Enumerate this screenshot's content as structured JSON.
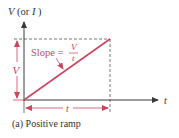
{
  "diagram": {
    "y_axis_label": {
      "main": "V",
      "paren_open": " (or ",
      "alt": "I",
      "paren_close": " )"
    },
    "x_axis_label": "t",
    "height_label": "V",
    "width_label": "t",
    "slope": {
      "prefix": "Slope =",
      "numerator": "V",
      "denominator": "t"
    },
    "caption": "(a) Positive ramp",
    "colors": {
      "ramp": "#c8465f",
      "axis": "#3a3a3a",
      "dashed": "#555555",
      "dimension": "#c8465f",
      "text": "#333333"
    }
  }
}
